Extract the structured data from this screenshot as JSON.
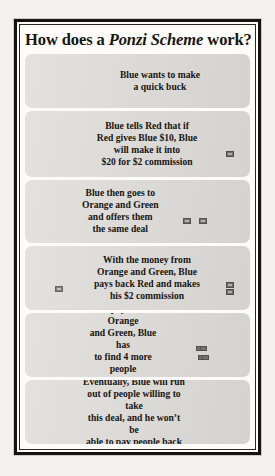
{
  "poster": {
    "title_prefix": "How does a ",
    "title_emphasis": "Ponzi Scheme",
    "title_suffix": " work?",
    "title_full": "How does a Ponzi Scheme work?",
    "figure_color": "#8d8d8c",
    "panel_background": "#dedcd8",
    "border_color": "#141312",
    "page_background": "#f3f1ee"
  },
  "panels": [
    {
      "id": "panel-1",
      "text": "Blue wants to make\na quick buck",
      "lines": [
        "Blue wants to make",
        "a quick buck"
      ],
      "left_figures": 1,
      "right_figures": 0,
      "money_icons": 0
    },
    {
      "id": "panel-2",
      "text": "Blue tells Red that if Red gives Blue $10, Blue will make it into $20 for $2 commission",
      "lines": [
        "Blue tells Red that if",
        "Red gives Blue $10, Blue",
        "will make it into",
        "$20 for $2 commission"
      ],
      "left_figures": 1,
      "right_figures": 1,
      "money_icons": 1
    },
    {
      "id": "panel-3",
      "text": "Blue then goes to Orange and Green and offers them the same deal",
      "lines": [
        "Blue then goes to",
        "Orange and Green",
        "and offers them",
        "the same deal"
      ],
      "left_figures": 1,
      "right_figures": 2,
      "money_icons": 2
    },
    {
      "id": "panel-4",
      "text": "With the money from Orange and Green, Blue pays back Red and makes his $2 commission",
      "lines": [
        "With the money from",
        "Orange and Green, Blue",
        "pays back Red and makes",
        "his $2 commission"
      ],
      "left_figures": 1,
      "right_figures": 1,
      "money_icons": 3
    },
    {
      "id": "panel-5",
      "text": "To pay back Orange and Green, Blue has to find 4 more people to take this deal",
      "lines": [
        "To pay back Orange",
        "and Green, Blue has",
        "to find 4 more people",
        "to take this deal"
      ],
      "left_figures": 1,
      "right_figures": 4,
      "money_icons": 4
    },
    {
      "id": "panel-6",
      "text": "Eventually, Blue will run out of people willing to take this deal, and he won’t be able to pay people back",
      "lines": [
        "Eventually, Blue will run",
        "out of people willing to take",
        "this deal, and he won’t be",
        "able to pay people back"
      ],
      "left_figures": 1,
      "right_figures": 8,
      "money_icons": 0
    }
  ]
}
